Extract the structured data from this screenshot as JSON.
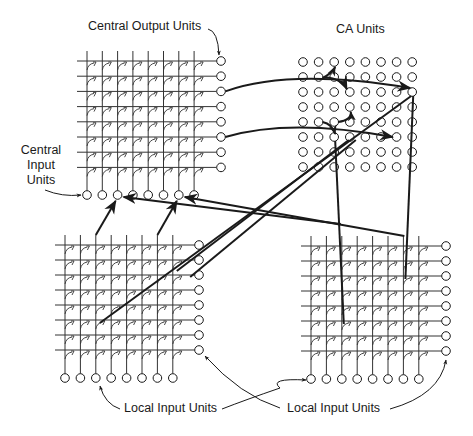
{
  "diagram": {
    "type": "neural-network-architecture",
    "colors": {
      "background": "#ffffff",
      "ink": "#1a1a1a",
      "grid_line": "#333333"
    },
    "labels": {
      "central_output": "Central Output Units",
      "ca_units": "CA Units",
      "central_input_line1": "Central",
      "central_input_line2": "Input",
      "central_input_line3": "Units",
      "local_input_left": "Local Input Units",
      "local_input_right": "Local Input Units"
    },
    "modules": [
      {
        "id": "central",
        "name": "Central module",
        "rows": 8,
        "cols": 8,
        "origin_x": 87,
        "origin_y": 61,
        "dx": 15.3,
        "dy": 15.2,
        "line_start_x": 77,
        "out_x": 221,
        "in_y": 195
      },
      {
        "id": "local-left",
        "name": "Local module (left)",
        "rows": 8,
        "cols": 8,
        "origin_x": 65,
        "origin_y": 245,
        "dx": 15.4,
        "dy": 15.0,
        "line_start_x": 55,
        "out_x": 199,
        "in_y": 378
      },
      {
        "id": "local-right",
        "name": "Local module (right)",
        "rows": 8,
        "cols": 8,
        "origin_x": 311,
        "origin_y": 246,
        "dx": 15.4,
        "dy": 15.0,
        "line_start_x": 301,
        "out_x": 446,
        "in_y": 379
      }
    ],
    "ca_grid": {
      "rows": 8,
      "cols": 8,
      "origin_x": 303,
      "origin_y": 62,
      "dx": 15.6,
      "dy": 15.0,
      "radius": 4.3
    },
    "unit_radius": 4.3,
    "connections": [
      {
        "from": "central-output-row3",
        "to": "ca-row3-col3",
        "kind": "curve"
      },
      {
        "from": "central-output-row3",
        "to": "ca-row3-col7",
        "kind": "curve"
      },
      {
        "from": "central-output-row3",
        "to": "ca-row1-col3",
        "kind": "branch"
      },
      {
        "from": "central-output-row6",
        "to": "ca-row6-col3",
        "kind": "curve"
      },
      {
        "from": "central-output-row6",
        "to": "ca-row6-col6",
        "kind": "curve"
      },
      {
        "from": "central-output-row6",
        "to": "ca-row4-col4",
        "kind": "branch"
      },
      {
        "from": "ca-row3-col7",
        "to": "local-left-synapse",
        "kind": "double-line"
      },
      {
        "from": "ca-row6-col3",
        "to": "local-right-col3",
        "kind": "line"
      },
      {
        "from": "ca-row3-col7",
        "to": "local-right-col7",
        "kind": "line"
      },
      {
        "from": "local-left-col3",
        "to": "central-input-col3",
        "kind": "arrow"
      },
      {
        "from": "local-left-col7",
        "to": "central-input-col7",
        "kind": "arrow"
      },
      {
        "from": "local-right-col3",
        "to": "central-input-col3",
        "kind": "arrow"
      },
      {
        "from": "local-right-col7",
        "to": "central-input-col7",
        "kind": "arrow"
      }
    ]
  }
}
